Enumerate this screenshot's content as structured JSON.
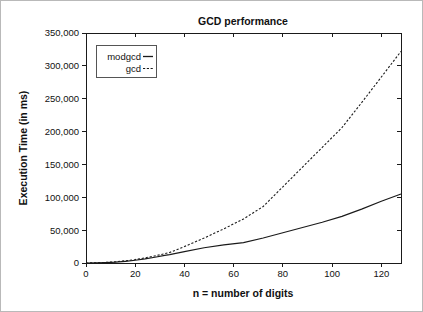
{
  "chart_data": {
    "type": "line",
    "title": "GCD performance",
    "xlabel": "n = number of digits",
    "ylabel": "Execution Time (in ms)",
    "xlim": [
      0,
      128
    ],
    "ylim": [
      0,
      350000
    ],
    "grid": false,
    "legend_position": "top-left",
    "xticks": [
      0,
      20,
      40,
      60,
      80,
      100,
      120
    ],
    "xtick_labels": [
      "0",
      "20",
      "40",
      "60",
      "80",
      "100",
      "120"
    ],
    "yticks": [
      0,
      50000,
      100000,
      150000,
      200000,
      250000,
      300000,
      350000
    ],
    "ytick_labels": [
      "0",
      "50,000",
      "100,000",
      "150,000",
      "200,000",
      "250,000",
      "300,000",
      "350,000"
    ],
    "x": [
      0,
      4,
      8,
      12,
      16,
      20,
      24,
      28,
      32,
      34,
      40,
      48,
      56,
      64,
      72,
      80,
      88,
      96,
      104,
      112,
      120,
      128
    ],
    "series": [
      {
        "name": "modgcd",
        "style": "solid",
        "color": "#1a1a1a",
        "values": [
          0,
          200,
          600,
          1300,
          2600,
          4200,
          6200,
          8700,
          11600,
          12800,
          17200,
          23200,
          27500,
          31000,
          38000,
          46000,
          54000,
          62000,
          71000,
          82000,
          94000,
          105000
        ]
      },
      {
        "name": "gcd",
        "style": "dashed",
        "color": "#1a1a1a",
        "values": [
          0,
          300,
          900,
          1900,
          3400,
          5300,
          7800,
          10800,
          14200,
          16000,
          25000,
          38000,
          52000,
          67000,
          86000,
          116000,
          146000,
          176000,
          206000,
          244000,
          283000,
          322000
        ]
      }
    ]
  },
  "legend": {
    "entries": [
      {
        "label": "modgcd",
        "style": "solid"
      },
      {
        "label": "gcd",
        "style": "dashed"
      }
    ]
  }
}
